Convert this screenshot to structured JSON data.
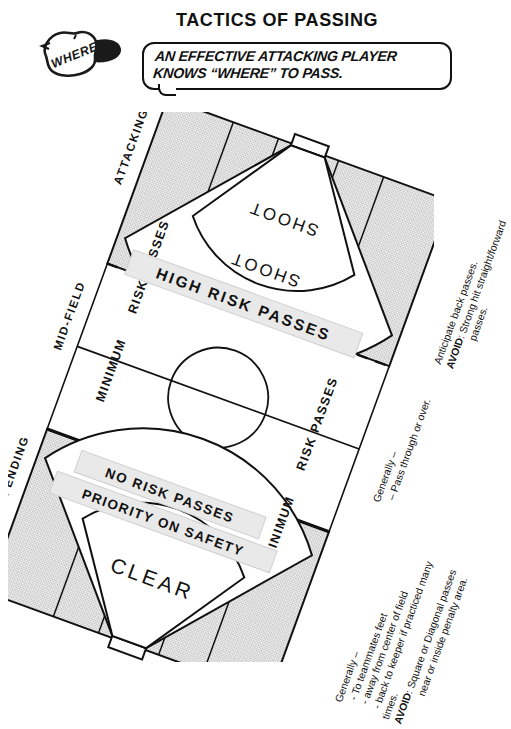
{
  "page": {
    "title": "TACTICS OF PASSING",
    "logo_text": "WHERE",
    "logo_icon": "cap-with-where-label-icon"
  },
  "callout": {
    "line1_a": "AN EFFECTIVE ATTACKING PLAYER",
    "line2_a": "KNOWS “",
    "line2_emphasis": "WHERE",
    "line2_b": "” TO PASS."
  },
  "pitch": {
    "thirds": [
      {
        "name": "attacking",
        "label": "ATTACKING",
        "shaded": true
      },
      {
        "name": "mid-field",
        "label": "MID-FIELD",
        "shaded": false
      },
      {
        "name": "defending",
        "label": "DEFENDING",
        "shaded": true
      }
    ],
    "banners": [
      {
        "name": "high-risk",
        "label": "HIGH RISK PASSES"
      },
      {
        "name": "no-risk",
        "label": "NO RISK PASSES"
      },
      {
        "name": "priority-safety",
        "label": "PRIORITY ON SAFETY"
      }
    ],
    "zone_labels": {
      "shoot_inner": "SHOOT",
      "shoot_outer": "SHOOT",
      "clear_inner": "CLEAR",
      "clear_outer": "CLEAR",
      "minimum_left": "MINIMUM",
      "risk_passes_left": "RISK PASSES",
      "minimum_right": "MINIMUM",
      "risk_passes_right": "RISK PASSES"
    }
  },
  "annotations": {
    "attacking_note": {
      "name": "attacking-third-note",
      "line1": "Anticipate back passes.",
      "avoid_label": "AVOID",
      "avoid_text": ": Strong hit straight/forward",
      "avoid_cont": "passes."
    },
    "midfield_note": {
      "name": "mid-field-note",
      "line1": "Generally –",
      "line2": "– Pass through or over."
    },
    "defending_note": {
      "name": "defending-third-note",
      "line1": "Generally –",
      "line2": "- To teammates feet",
      "line3": "- away from center of field",
      "line4": "- back to keeper if practiced many",
      "line5": "times.",
      "avoid_label": "AVOID",
      "avoid_text": ": Square or Diagonal passes",
      "avoid_cont": "near or inside penalty area."
    }
  },
  "colors": {
    "ink": "#111111",
    "shaded_third": "#d4d4d4",
    "banner_fill": "#e9e9e9",
    "paper": "#ffffff"
  }
}
